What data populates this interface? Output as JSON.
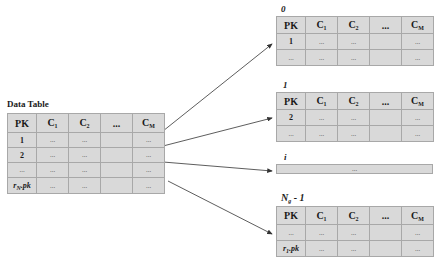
{
  "source_table": {
    "title": "Data Table",
    "headers": [
      "PK",
      "C1",
      "C2",
      "...",
      "CM"
    ],
    "rows": [
      [
        "1",
        "...",
        "...",
        "",
        "..."
      ],
      [
        "2",
        "...",
        "...",
        "",
        "..."
      ],
      [
        "...",
        "...",
        "...",
        "",
        "..."
      ],
      [
        "rN.pk",
        "...",
        "...",
        "",
        "..."
      ]
    ]
  },
  "partitions": [
    {
      "label": "0",
      "headers": [
        "PK",
        "C1",
        "C2",
        "...",
        "CM"
      ],
      "rows": [
        [
          "1",
          "...",
          "...",
          "",
          "..."
        ],
        [
          "...",
          "...",
          "...",
          "",
          "..."
        ]
      ]
    },
    {
      "label": "1",
      "headers": [
        "PK",
        "C1",
        "C2",
        "...",
        "CM"
      ],
      "rows": [
        [
          "2",
          "...",
          "...",
          "",
          "..."
        ],
        [
          "...",
          "...",
          "...",
          "",
          "..."
        ]
      ]
    },
    {
      "label": "i",
      "collapsed_text": "..."
    },
    {
      "label": "Ng - 1",
      "headers": [
        "PK",
        "C1",
        "C2",
        "...",
        "CM"
      ],
      "rows": [
        [
          "...",
          "...",
          "...",
          "",
          "..."
        ],
        [
          "r1.pk",
          "...",
          "...",
          "",
          "..."
        ]
      ]
    }
  ],
  "colors": {
    "cell_fill": "#d9d9d9",
    "cell_border": "#a8a8a8",
    "arrow": "#333333"
  }
}
